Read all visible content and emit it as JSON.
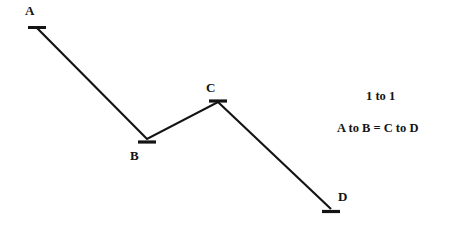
{
  "canvas": {
    "width": 456,
    "height": 229,
    "background_color": "#ffffff",
    "ink_color": "#141414"
  },
  "chart_data": {
    "type": "line",
    "title": "",
    "subtitle": "",
    "xlabel": "",
    "ylabel": "",
    "grid": false,
    "legend": "none",
    "axis_visible": false,
    "xlim": [
      0,
      456
    ],
    "ylim": [
      229,
      0
    ],
    "series": [
      {
        "name": "ABCD zigzag",
        "stroke_color": "#141414",
        "stroke_width": 2,
        "points": [
          {
            "label": "A",
            "x": 37,
            "y": 28
          },
          {
            "label": "B",
            "x": 147,
            "y": 139
          },
          {
            "label": "C",
            "x": 218,
            "y": 102
          },
          {
            "label": "D",
            "x": 331,
            "y": 209
          }
        ]
      }
    ],
    "segments": [
      {
        "name": "A to B",
        "from": "A",
        "to": "B",
        "direction": "down"
      },
      {
        "name": "B to C",
        "from": "B",
        "to": "C",
        "direction": "up"
      },
      {
        "name": "C to D",
        "from": "C",
        "to": "D",
        "direction": "down"
      }
    ],
    "markers": {
      "style": "horizontal-tick",
      "width": 18,
      "thickness": 3,
      "color": "#141414"
    },
    "annotations": [
      {
        "name": "ratio",
        "text": "1 to 1",
        "x": 385,
        "y": 96
      },
      {
        "name": "equality",
        "text": "A to B = C to D",
        "x": 387,
        "y": 128
      }
    ]
  },
  "labels": {
    "point_a": "A",
    "point_b": "B",
    "point_c": "C",
    "point_d": "D"
  },
  "notes": {
    "ratio": "1 to 1",
    "equality": "A to B = C to D"
  }
}
